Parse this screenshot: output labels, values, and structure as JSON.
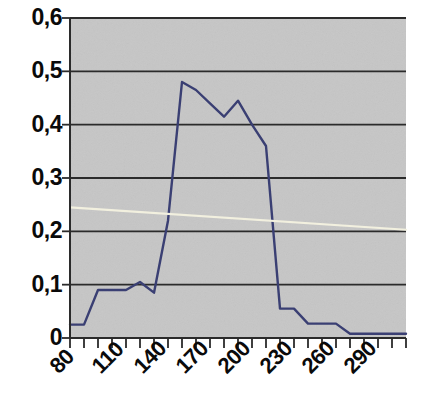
{
  "chart_data": {
    "type": "line",
    "title": "",
    "subtitle": "",
    "xlabel": "",
    "ylabel": "",
    "xlim": [
      80,
      320
    ],
    "ylim": [
      0,
      0.6
    ],
    "grid": true,
    "grid_axis": "y",
    "legend": false,
    "legend_position": "none",
    "plot_background": "#c6c6c6",
    "y_ticks": [
      0,
      0.1,
      0.2,
      0.3,
      0.4,
      0.5,
      0.6
    ],
    "y_tick_labels": [
      "0",
      "0,1",
      "0,2",
      "0,3",
      "0,4",
      "0,5",
      "0,6"
    ],
    "x_ticks": [
      80,
      90,
      100,
      110,
      120,
      130,
      140,
      150,
      160,
      170,
      180,
      190,
      200,
      210,
      220,
      230,
      240,
      250,
      260,
      270,
      280,
      290,
      300,
      310,
      320
    ],
    "x_tick_labels": [
      "80",
      "110",
      "140",
      "170",
      "200",
      "230",
      "260",
      "290"
    ],
    "x_labeled_ticks": [
      80,
      110,
      140,
      170,
      200,
      230,
      260,
      290
    ],
    "series": [
      {
        "name": "distribution",
        "color": "#3a3f73",
        "width": 2.4,
        "x": [
          80,
          90,
          100,
          110,
          120,
          130,
          140,
          150,
          160,
          170,
          180,
          190,
          200,
          210,
          220,
          230,
          240,
          250,
          260,
          270,
          280,
          290,
          300,
          310,
          320
        ],
        "values": [
          0.025,
          0.025,
          0.09,
          0.09,
          0.09,
          0.105,
          0.085,
          0.22,
          0.48,
          0.465,
          0.44,
          0.415,
          0.445,
          0.4,
          0.36,
          0.055,
          0.055,
          0.027,
          0.027,
          0.027,
          0.008,
          0.008,
          0.008,
          0.008,
          0.008
        ]
      },
      {
        "name": "trend",
        "color": "#f2f0df",
        "width": 2.2,
        "x": [
          80,
          320
        ],
        "values": [
          0.245,
          0.203
        ]
      }
    ]
  }
}
